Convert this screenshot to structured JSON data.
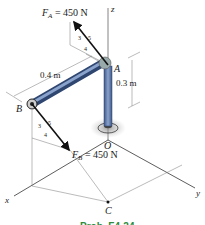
{
  "figure": {
    "force_a_label": "F",
    "force_a_sub": "A",
    "force_a_value": " = 450 N",
    "force_b_label": "F",
    "force_b_sub": "B",
    "force_b_value": " = 450 N",
    "slope_a": {
      "rise": "3",
      "hyp": "5",
      "run": "4"
    },
    "slope_b": {
      "rise": "3",
      "hyp": "5",
      "run": "4"
    },
    "dim_ab": "0.4 m",
    "dim_height": "0.3 m",
    "points": {
      "A": "A",
      "B": "B",
      "O": "O",
      "C": "C"
    },
    "axes": {
      "x": "x",
      "y": "y",
      "z": "z"
    },
    "caption": "Prob. F4-24"
  },
  "colors": {
    "pipe": "#5a77a8",
    "pipe_dark": "#2f4670",
    "line": "#1a1a1a",
    "thin_line": "#555555",
    "caption": "#2e8b3c"
  }
}
